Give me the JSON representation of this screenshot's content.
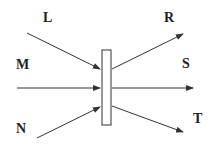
{
  "diagram": {
    "labels": {
      "L": "L",
      "M": "M",
      "N": "N",
      "R": "R",
      "S": "S",
      "T": "T"
    },
    "colors": {
      "line": "#333333",
      "box_fill": "#ffffff"
    }
  }
}
